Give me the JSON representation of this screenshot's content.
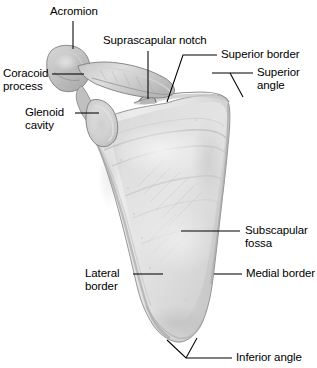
{
  "figure": {
    "background_color": "#ffffff",
    "bone_fill_light": "#e9e9e9",
    "bone_fill_mid": "#d2d2d2",
    "bone_fill_dark": "#b4b4b4",
    "outline_color": "#7a7a7a",
    "leader_color": "#000000",
    "text_color": "#000000"
  },
  "labels": {
    "acromion": "Acromion",
    "suprascapular_notch": "Suprascapular notch",
    "superior_border": "Superior border",
    "superior_angle_line1": "Superior",
    "superior_angle_line2": "angle",
    "coracoid_line1": "Coracoid",
    "coracoid_line2": "process",
    "glenoid_line1": "Glenoid",
    "glenoid_line2": "cavity",
    "subscapular_line1": "Subscapular",
    "subscapular_line2": "fossa",
    "lateral_line1": "Lateral",
    "lateral_line2": "border",
    "medial_border": "Medial border",
    "inferior_angle": "Inferior angle"
  }
}
